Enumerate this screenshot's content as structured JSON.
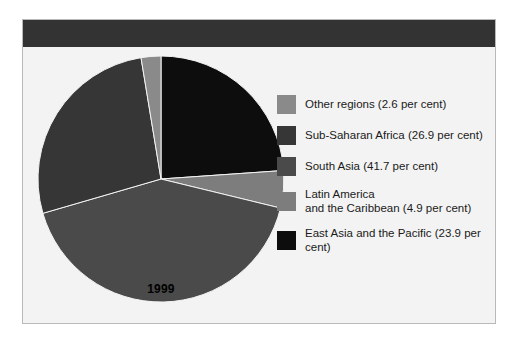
{
  "panel": {
    "background_color": "#f3f3f3",
    "border_color": "#b9b9b9",
    "header_band_color": "#333333"
  },
  "chart_data": {
    "type": "pie",
    "title": "",
    "subtitle": "",
    "xlabel": "",
    "ylabel": "",
    "year_label": "1999",
    "units": "per cent",
    "start_angle_deg": 0,
    "direction": "clockwise",
    "legend_position": "right",
    "grid": false,
    "categories": [
      "East Asia and the Pacific",
      "Latin America and the Caribbean",
      "South Asia",
      "Sub-Saharan Africa",
      "Other regions"
    ],
    "values": [
      23.9,
      4.9,
      41.7,
      26.9,
      2.6
    ],
    "colors": [
      "#0d0d0d",
      "#7d7d7d",
      "#4a4a4a",
      "#363636",
      "#8a8a8a"
    ],
    "slices": [
      {
        "label": "East Asia and the Pacific",
        "value": 23.9,
        "color": "#0d0d0d"
      },
      {
        "label": "Latin America and the Caribbean",
        "value": 4.9,
        "color": "#7d7d7d"
      },
      {
        "label": "South Asia",
        "value": 41.7,
        "color": "#4a4a4a"
      },
      {
        "label": "Sub-Saharan Africa",
        "value": 26.9,
        "color": "#363636"
      },
      {
        "label": "Other regions",
        "value": 2.6,
        "color": "#8a8a8a"
      }
    ]
  },
  "legend": {
    "items": [
      {
        "label": "Other regions (2.6 per cent)",
        "color": "#8a8a8a"
      },
      {
        "label": "Sub-Saharan Africa (26.9 per cent)",
        "color": "#363636"
      },
      {
        "label": "South Asia (41.7 per cent)",
        "color": "#4a4a4a"
      },
      {
        "label": "Latin America\nand the Caribbean (4.9 per cent)",
        "color": "#7d7d7d"
      },
      {
        "label": "East Asia and the Pacific (23.9 per cent)",
        "color": "#0d0d0d"
      }
    ]
  }
}
